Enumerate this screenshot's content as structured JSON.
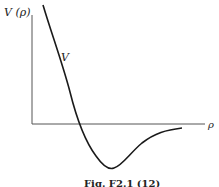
{
  "figure": {
    "y_axis_label": "V (ρ)",
    "x_axis_label": "ρ",
    "curve_label": "V",
    "caption": "Fig. F2.1 (12)"
  },
  "colors": {
    "line": "#1a1a1a",
    "axis": "#444444",
    "background": "#ffffff"
  }
}
